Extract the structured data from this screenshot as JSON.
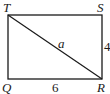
{
  "diagram": {
    "type": "rectangle-with-diagonal",
    "vertices": [
      {
        "name": "T",
        "position": "top-left"
      },
      {
        "name": "S",
        "position": "top-right"
      },
      {
        "name": "R",
        "position": "bottom-right"
      },
      {
        "name": "Q",
        "position": "bottom-left"
      }
    ],
    "labels": {
      "T": "T",
      "S": "S",
      "R": "R",
      "Q": "Q",
      "diagonal": "a",
      "side_SR": "4",
      "side_QR": "6"
    },
    "segments": [
      {
        "from": "T",
        "to": "S"
      },
      {
        "from": "S",
        "to": "R",
        "length": "4"
      },
      {
        "from": "R",
        "to": "Q",
        "length": "6"
      },
      {
        "from": "Q",
        "to": "T"
      },
      {
        "from": "T",
        "to": "R",
        "length": "a"
      }
    ],
    "stroke_color": "#1a1a1a"
  }
}
